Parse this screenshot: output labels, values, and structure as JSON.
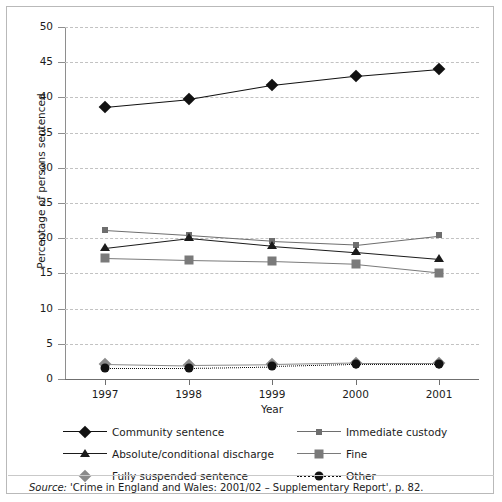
{
  "chart_data": {
    "type": "line",
    "title": "",
    "xlabel": "Year",
    "ylabel": "Percentage of persons sentenced",
    "categories": [
      "1997",
      "1998",
      "1999",
      "2000",
      "2001"
    ],
    "x": [
      1997,
      1998,
      1999,
      2000,
      2001
    ],
    "ylim": [
      0,
      50
    ],
    "yticks": [
      0,
      5,
      10,
      15,
      20,
      25,
      30,
      35,
      40,
      45,
      50
    ],
    "grid": "horizontal-dashed",
    "legend_position": "below-axes",
    "series": [
      {
        "name": "Community sentence",
        "values": [
          38.7,
          39.8,
          41.8,
          43.1,
          44.1
        ],
        "color": "#111111",
        "marker": "diamond",
        "line": "solid"
      },
      {
        "name": "Immediate custody",
        "values": [
          21.1,
          20.4,
          19.6,
          19.1,
          20.4
        ],
        "color": "#6e6e6e",
        "marker": "small-square",
        "line": "solid"
      },
      {
        "name": "Absolute/conditional discharge",
        "values": [
          18.6,
          20.0,
          18.9,
          18.0,
          17.0
        ],
        "color": "#1b1b1b",
        "marker": "triangle",
        "line": "solid"
      },
      {
        "name": "Fine",
        "values": [
          17.2,
          16.9,
          16.7,
          16.3,
          15.1
        ],
        "color": "#7a7a7a",
        "marker": "large-square",
        "line": "solid"
      },
      {
        "name": "Fully suspended sentence",
        "values": [
          2.2,
          2.0,
          2.1,
          2.3,
          2.3
        ],
        "color": "#8a8a8a",
        "marker": "diamond",
        "line": "solid"
      },
      {
        "name": "Other",
        "values": [
          1.6,
          1.6,
          1.8,
          2.1,
          2.1
        ],
        "color": "#111111",
        "marker": "circle",
        "line": "dotted"
      }
    ]
  },
  "source": {
    "label": "Source:",
    "text": " 'Crime in England and Wales: 2001/02 – Supplementary Report', p. 82."
  }
}
